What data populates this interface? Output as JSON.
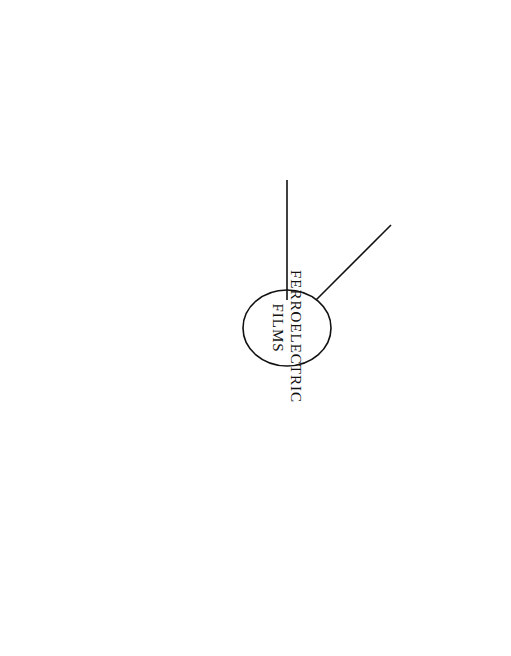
{
  "figure": {
    "number_label": "FIGURE 4.3",
    "caption": "Applications of the ferroelectric thin films.",
    "center_label_line1": "FERROELECTRIC",
    "center_label_line2": "FILMS"
  },
  "effects": [
    {
      "id": "dielectric",
      "line1": "Large",
      "line2": "Dielectric Constant"
    },
    {
      "id": "pyroelectricity",
      "line1": "Pyroelectricity"
    },
    {
      "id": "acousto_optic",
      "line1": "Acousto-Optic Effect"
    },
    {
      "id": "ferroelectricity",
      "line1": "Ferroelectricity",
      "line2": "(P_s hysteresis)"
    },
    {
      "id": "electro_optic",
      "line1": "Electro-Optic Effect"
    },
    {
      "id": "piezoelectricity",
      "line1": "Piezoelectricity"
    }
  ],
  "applications": [
    {
      "id": "capacitor",
      "line1": "Multilayer",
      "line2": "ceramic capacitor",
      "labels": [
        "External electrode",
        "Internal electrode",
        "Ferroelectric films"
      ]
    },
    {
      "id": "infrared",
      "line1": "Infrared sensor",
      "labels": [
        "Infrared radiation",
        "Ni-Cr electrode",
        "PLT film",
        "Ni-Cr electrode",
        "MgO"
      ]
    },
    {
      "id": "bragg",
      "line1": "A-O Bragg deflector",
      "labels": [
        "Diffracted",
        "Undiffracted",
        "GaP Prism",
        "SAW",
        "IDT",
        "PLZT film",
        "Sapphire",
        "Incident"
      ]
    },
    {
      "id": "memory",
      "line1": "Nonvolatile memory",
      "labels": [
        "Drain",
        "Metal electrode",
        "Gate",
        "Source",
        "Ferroelectric (Bi4Ti3O12) film",
        "N+",
        "N+",
        "n-Channel",
        "p-Silicon"
      ]
    },
    {
      "id": "waveguide",
      "line1": "E-O waveguide modulator",
      "labels": [
        "Voltage",
        "Deposited gold electrodes",
        "Output",
        "Input",
        "LiNbO3 film",
        "Mach-Zehnder interferometer"
      ]
    },
    {
      "id": "phase",
      "line1": "",
      "labels": [
        "Modulated light",
        "Substrate",
        "Electrodes",
        "Phase modulator",
        "LiNbO3 film",
        "Light"
      ]
    },
    {
      "id": "bimorph",
      "line1": "Bimorph structure actuator",
      "labels": [
        "Electrodes",
        "Metal shim (Internal electrode)",
        "Polarization direction",
        "Displacement",
        "PZT films",
        "Free end"
      ]
    }
  ]
}
